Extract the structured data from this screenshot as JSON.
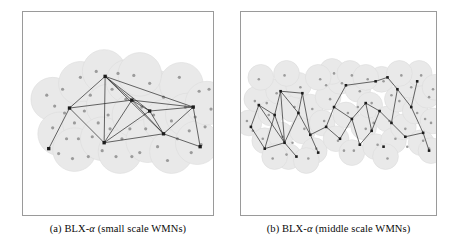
{
  "figure": {
    "panels": [
      {
        "id": "a",
        "caption_prefix": "(a)",
        "caption_algorithm": "BLX-",
        "caption_alpha": "α",
        "caption_suffix": "(small scale WMNs)",
        "caption_full": "(a) BLX-α (small scale WMNs)"
      },
      {
        "id": "b",
        "caption_prefix": "(b)",
        "caption_algorithm": "BLX-",
        "caption_alpha": "α",
        "caption_suffix": "(middle scale WMNs)",
        "caption_full": "(b) BLX-α (middle scale WMNs)"
      }
    ]
  },
  "colors": {
    "panel_border": "#9a9a9a",
    "coverage_fill": "#e9e9e9",
    "coverage_stroke": "#dcdcdc",
    "client_dot": "#9b9b9b",
    "router_node": "#1c1c1c",
    "link_edge": "#262626",
    "background": "#ffffff",
    "caption_text": "#0a0a0a"
  },
  "chart_data": {
    "type": "scatter",
    "xlabel": "",
    "ylabel": "",
    "xlim": [
      0,
      192
    ],
    "ylim": [
      0,
      205
    ],
    "grid": false,
    "legend": "none",
    "series": [
      {
        "name": "panel-a-coverage-circles",
        "panel": "a",
        "marker": "circle-filled",
        "radius": 22,
        "points": [
          [
            30,
            88
          ],
          [
            37,
            123
          ],
          [
            58,
            72
          ],
          [
            62,
            112
          ],
          [
            52,
            139
          ],
          [
            82,
            60
          ],
          [
            86,
            95
          ],
          [
            80,
            128
          ],
          [
            98,
            141
          ],
          [
            106,
            70
          ],
          [
            112,
            104
          ],
          [
            126,
            130
          ],
          [
            132,
            80
          ],
          [
            144,
            110
          ],
          [
            150,
            141
          ],
          [
            160,
            73
          ],
          [
            166,
            104
          ],
          [
            176,
            132
          ],
          [
            186,
            92
          ],
          [
            118,
            63
          ]
        ]
      },
      {
        "name": "panel-a-mesh-clients",
        "panel": "a",
        "marker": "dot",
        "radius": 1.6,
        "points": [
          [
            24,
            84
          ],
          [
            32,
            95
          ],
          [
            40,
            78
          ],
          [
            30,
            117
          ],
          [
            44,
            128
          ],
          [
            52,
            112
          ],
          [
            36,
            143
          ],
          [
            50,
            148
          ],
          [
            58,
            66
          ],
          [
            68,
            84
          ],
          [
            74,
            60
          ],
          [
            62,
            100
          ],
          [
            70,
            126
          ],
          [
            80,
            140
          ],
          [
            88,
            118
          ],
          [
            96,
            62
          ],
          [
            90,
            78
          ],
          [
            104,
            88
          ],
          [
            112,
            64
          ],
          [
            100,
            128
          ],
          [
            110,
            146
          ],
          [
            120,
            96
          ],
          [
            128,
            72
          ],
          [
            124,
            118
          ],
          [
            136,
            136
          ],
          [
            142,
            86
          ],
          [
            150,
            110
          ],
          [
            158,
            66
          ],
          [
            156,
            128
          ],
          [
            164,
            96
          ],
          [
            170,
            142
          ],
          [
            178,
            80
          ],
          [
            184,
            116
          ],
          [
            190,
            98
          ],
          [
            146,
            150
          ],
          [
            118,
            142
          ],
          [
            66,
            146
          ],
          [
            42,
            102
          ],
          [
            86,
            104
          ],
          [
            132,
            104
          ],
          [
            174,
            106
          ],
          [
            108,
            118
          ],
          [
            94,
            146
          ],
          [
            56,
            128
          ],
          [
            168,
            120
          ],
          [
            180,
            134
          ],
          [
            188,
            78
          ],
          [
            76,
            112
          ]
        ]
      },
      {
        "name": "panel-a-mesh-routers",
        "panel": "a",
        "marker": "square-filled",
        "size": 3.4,
        "points": [
          [
            26,
            138
          ],
          [
            47,
            97
          ],
          [
            83,
            65
          ],
          [
            82,
            132
          ],
          [
            110,
            89
          ],
          [
            128,
            100
          ],
          [
            142,
            123
          ],
          [
            172,
            96
          ],
          [
            179,
            136
          ]
        ]
      },
      {
        "name": "panel-a-links",
        "panel": "a",
        "marker": "line",
        "edges": [
          [
            26,
            138,
            47,
            97
          ],
          [
            47,
            97,
            83,
            65
          ],
          [
            47,
            97,
            82,
            132
          ],
          [
            47,
            97,
            110,
            89
          ],
          [
            83,
            65,
            82,
            132
          ],
          [
            83,
            65,
            110,
            89
          ],
          [
            83,
            65,
            128,
            100
          ],
          [
            83,
            65,
            142,
            123
          ],
          [
            82,
            132,
            110,
            89
          ],
          [
            82,
            132,
            128,
            100
          ],
          [
            110,
            89,
            128,
            100
          ],
          [
            110,
            89,
            142,
            123
          ],
          [
            128,
            100,
            142,
            123
          ],
          [
            128,
            100,
            172,
            96
          ],
          [
            142,
            123,
            172,
            96
          ],
          [
            142,
            123,
            179,
            136
          ],
          [
            172,
            96,
            179,
            136
          ],
          [
            83,
            65,
            172,
            96
          ],
          [
            110,
            89,
            172,
            96
          ],
          [
            82,
            132,
            142,
            123
          ]
        ]
      },
      {
        "name": "panel-b-coverage-circles",
        "panel": "b",
        "marker": "circle-filled",
        "radius": 13,
        "points": [
          [
            8,
            112
          ],
          [
            16,
            88
          ],
          [
            24,
            130
          ],
          [
            30,
            102
          ],
          [
            38,
            80
          ],
          [
            40,
            124
          ],
          [
            48,
            146
          ],
          [
            52,
            98
          ],
          [
            58,
            74
          ],
          [
            62,
            120
          ],
          [
            70,
            96
          ],
          [
            74,
            140
          ],
          [
            82,
            112
          ],
          [
            88,
            86
          ],
          [
            96,
            128
          ],
          [
            100,
            70
          ],
          [
            106,
            104
          ],
          [
            112,
            142
          ],
          [
            118,
            78
          ],
          [
            124,
            116
          ],
          [
            130,
            94
          ],
          [
            136,
            136
          ],
          [
            142,
            68
          ],
          [
            148,
            108
          ],
          [
            154,
            130
          ],
          [
            158,
            88
          ],
          [
            164,
            116
          ],
          [
            170,
            74
          ],
          [
            176,
            100
          ],
          [
            182,
            132
          ],
          [
            188,
            84
          ],
          [
            194,
            110
          ],
          [
            92,
            60
          ],
          [
            110,
            62
          ],
          [
            126,
            66
          ],
          [
            34,
            146
          ],
          [
            66,
            150
          ],
          [
            146,
            146
          ],
          [
            180,
            62
          ],
          [
            196,
            76
          ],
          [
            20,
            66
          ],
          [
            46,
            62
          ],
          [
            78,
            66
          ],
          [
            160,
            62
          ],
          [
            192,
            140
          ]
        ]
      },
      {
        "name": "panel-b-mesh-clients",
        "panel": "b",
        "marker": "dot",
        "radius": 1.3,
        "points": [
          [
            6,
            110
          ],
          [
            14,
            90
          ],
          [
            22,
            128
          ],
          [
            28,
            104
          ],
          [
            36,
            82
          ],
          [
            42,
            126
          ],
          [
            46,
            144
          ],
          [
            54,
            96
          ],
          [
            60,
            76
          ],
          [
            64,
            118
          ],
          [
            72,
            98
          ],
          [
            76,
            138
          ],
          [
            84,
            110
          ],
          [
            90,
            88
          ],
          [
            98,
            130
          ],
          [
            102,
            72
          ],
          [
            108,
            102
          ],
          [
            114,
            140
          ],
          [
            120,
            80
          ],
          [
            126,
            118
          ],
          [
            132,
            92
          ],
          [
            138,
            134
          ],
          [
            144,
            70
          ],
          [
            150,
            110
          ],
          [
            156,
            128
          ],
          [
            160,
            90
          ],
          [
            166,
            118
          ],
          [
            172,
            76
          ],
          [
            178,
            102
          ],
          [
            184,
            130
          ],
          [
            190,
            86
          ],
          [
            192,
            112
          ],
          [
            94,
            62
          ],
          [
            112,
            64
          ],
          [
            128,
            68
          ],
          [
            32,
            148
          ],
          [
            68,
            148
          ],
          [
            148,
            148
          ],
          [
            182,
            64
          ],
          [
            194,
            78
          ],
          [
            18,
            68
          ],
          [
            44,
            64
          ],
          [
            80,
            68
          ],
          [
            162,
            64
          ],
          [
            190,
            138
          ],
          [
            12,
            120
          ],
          [
            26,
            92
          ],
          [
            52,
            132
          ],
          [
            86,
            74
          ],
          [
            104,
            140
          ],
          [
            118,
            96
          ],
          [
            134,
            112
          ],
          [
            152,
            84
          ],
          [
            168,
            136
          ],
          [
            186,
            108
          ]
        ]
      },
      {
        "name": "panel-b-mesh-routers",
        "panel": "b",
        "marker": "square-filled",
        "size": 2.6,
        "points": [
          [
            10,
            116
          ],
          [
            18,
            94
          ],
          [
            24,
            138
          ],
          [
            34,
            104
          ],
          [
            40,
            80
          ],
          [
            44,
            132
          ],
          [
            56,
            146
          ],
          [
            58,
            102
          ],
          [
            62,
            82
          ],
          [
            70,
            124
          ],
          [
            78,
            142
          ],
          [
            86,
            116
          ],
          [
            94,
            96
          ],
          [
            100,
            128
          ],
          [
            106,
            74
          ],
          [
            112,
            108
          ],
          [
            120,
            134
          ],
          [
            126,
            92
          ],
          [
            132,
            120
          ],
          [
            140,
            100
          ],
          [
            144,
            136
          ],
          [
            152,
            112
          ],
          [
            158,
            78
          ],
          [
            166,
            126
          ],
          [
            172,
            96
          ],
          [
            178,
            70
          ],
          [
            184,
            122
          ],
          [
            190,
            140
          ],
          [
            148,
            66
          ],
          [
            136,
            70
          ]
        ]
      },
      {
        "name": "panel-b-links",
        "panel": "b",
        "marker": "line",
        "edges": [
          [
            10,
            116,
            18,
            94
          ],
          [
            10,
            116,
            24,
            138
          ],
          [
            18,
            94,
            34,
            104
          ],
          [
            24,
            138,
            44,
            132
          ],
          [
            34,
            104,
            40,
            80
          ],
          [
            34,
            104,
            44,
            132
          ],
          [
            40,
            80,
            58,
            102
          ],
          [
            44,
            132,
            56,
            146
          ],
          [
            44,
            132,
            58,
            102
          ],
          [
            40,
            80,
            62,
            82
          ],
          [
            58,
            102,
            62,
            82
          ],
          [
            58,
            102,
            70,
            124
          ],
          [
            62,
            82,
            70,
            124
          ],
          [
            70,
            124,
            78,
            142
          ],
          [
            70,
            124,
            86,
            116
          ],
          [
            86,
            116,
            94,
            96
          ],
          [
            86,
            116,
            100,
            128
          ],
          [
            94,
            96,
            106,
            74
          ],
          [
            94,
            96,
            112,
            108
          ],
          [
            100,
            128,
            112,
            108
          ],
          [
            106,
            74,
            136,
            70
          ],
          [
            112,
            108,
            120,
            134
          ],
          [
            112,
            108,
            126,
            92
          ],
          [
            120,
            134,
            132,
            120
          ],
          [
            126,
            92,
            132,
            120
          ],
          [
            126,
            92,
            140,
            100
          ],
          [
            132,
            120,
            140,
            100
          ],
          [
            140,
            100,
            152,
            112
          ],
          [
            152,
            112,
            166,
            126
          ],
          [
            152,
            112,
            158,
            78
          ],
          [
            158,
            78,
            172,
            96
          ],
          [
            158,
            78,
            148,
            66
          ],
          [
            166,
            126,
            184,
            122
          ],
          [
            172,
            96,
            178,
            70
          ],
          [
            172,
            96,
            184,
            122
          ],
          [
            184,
            122,
            190,
            140
          ],
          [
            136,
            70,
            148,
            66
          ],
          [
            24,
            138,
            34,
            104
          ],
          [
            18,
            94,
            44,
            132
          ],
          [
            40,
            80,
            44,
            132
          ]
        ]
      }
    ]
  }
}
